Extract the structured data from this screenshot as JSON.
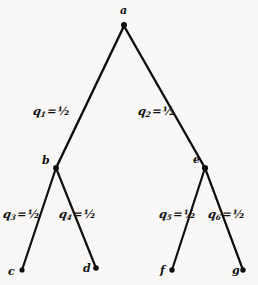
{
  "figure": {
    "type": "binary-probability-tree",
    "background_color": "#f9f8f6",
    "stroke_color": "#100f0e",
    "width": 258,
    "height": 285
  },
  "nodes": [
    {
      "id": "a",
      "label": "a",
      "x": 124,
      "y": 26,
      "level": 0,
      "kind": "root"
    },
    {
      "id": "b",
      "label": "b",
      "x": 56,
      "y": 168,
      "level": 1,
      "kind": "internal"
    },
    {
      "id": "e",
      "label": "e",
      "x": 205,
      "y": 168,
      "level": 1,
      "kind": "internal"
    },
    {
      "id": "c",
      "label": "c",
      "x": 22,
      "y": 270,
      "level": 2,
      "kind": "leaf"
    },
    {
      "id": "d",
      "label": "d",
      "x": 96,
      "y": 268,
      "level": 2,
      "kind": "leaf"
    },
    {
      "id": "f",
      "label": "f",
      "x": 172,
      "y": 270,
      "level": 2,
      "kind": "leaf"
    },
    {
      "id": "g",
      "label": "g",
      "x": 243,
      "y": 270,
      "level": 2,
      "kind": "leaf"
    }
  ],
  "edges": [
    {
      "id": "a-b",
      "from": "a",
      "to": "b",
      "symbol": "q",
      "subscript": "1",
      "value": "1/2",
      "label": "q1 = 1/2"
    },
    {
      "id": "a-e",
      "from": "a",
      "to": "e",
      "symbol": "q",
      "subscript": "2",
      "value": "1/2",
      "label": "q2 = 1/2"
    },
    {
      "id": "b-c",
      "from": "b",
      "to": "c",
      "symbol": "q",
      "subscript": "3",
      "value": "1/2",
      "label": "q3 = 1/2"
    },
    {
      "id": "b-d",
      "from": "b",
      "to": "d",
      "symbol": "q",
      "subscript": "4",
      "value": "1/2",
      "label": "q4 = 1/2"
    },
    {
      "id": "e-f",
      "from": "e",
      "to": "f",
      "symbol": "q",
      "subscript": "5",
      "value": "1/2",
      "label": "q5 = 1/2"
    },
    {
      "id": "e-g",
      "from": "e",
      "to": "g",
      "symbol": "q",
      "subscript": "6",
      "value": "1/2",
      "label": "q6 = 1/2"
    }
  ],
  "edge_labels": [
    {
      "id": "a-b",
      "symbol": "q",
      "subscript": "1",
      "eq": "=",
      "fraction": "½",
      "x": 33,
      "y": 106
    },
    {
      "id": "a-e",
      "symbol": "q",
      "subscript": "2",
      "eq": "=",
      "fraction": "½",
      "x": 138,
      "y": 106
    },
    {
      "id": "b-c",
      "symbol": "q",
      "subscript": "3",
      "eq": "=",
      "fraction": "½",
      "x": 3,
      "y": 209
    },
    {
      "id": "b-d",
      "symbol": "q",
      "subscript": "4",
      "eq": "=",
      "fraction": "½",
      "x": 59,
      "y": 209
    },
    {
      "id": "e-f",
      "symbol": "q",
      "subscript": "5",
      "eq": "=",
      "fraction": "½",
      "x": 159,
      "y": 209
    },
    {
      "id": "e-g",
      "symbol": "q",
      "subscript": "6",
      "eq": "=",
      "fraction": "½",
      "x": 208,
      "y": 209
    }
  ],
  "node_label_positions": [
    {
      "id": "a",
      "label": "a",
      "x": 120,
      "y": 5
    },
    {
      "id": "b",
      "label": "b",
      "x": 42,
      "y": 155
    },
    {
      "id": "e",
      "label": "e",
      "x": 193,
      "y": 154
    },
    {
      "id": "c",
      "label": "c",
      "x": 8,
      "y": 266
    },
    {
      "id": "d",
      "label": "d",
      "x": 83,
      "y": 263
    },
    {
      "id": "f",
      "label": "f",
      "x": 160,
      "y": 265
    },
    {
      "id": "g",
      "label": "g",
      "x": 232,
      "y": 265
    }
  ]
}
